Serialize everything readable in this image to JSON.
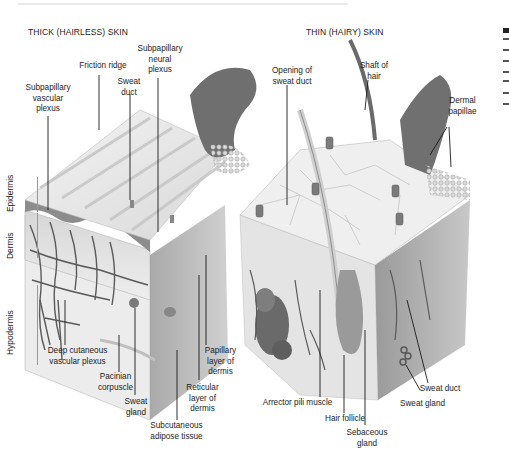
{
  "figure": {
    "thick_skin": {
      "title": "THICK (HAIRLESS) SKIN",
      "labels": {
        "friction_ridge": "Friction ridge",
        "subpapillary_neural_plexus": "Subpapillary\nneural\nplexus",
        "sweat_duct": "Sweat\nduct",
        "subpapillary_vascular_plexus": "Subpapillary\nvascular\nplexus",
        "deep_cutaneous_vascular_plexus": "Deep cutaneous\nvascular plexus",
        "pacinian_corpuscle": "Pacinian\ncorpuscle",
        "sweat_gland": "Sweat\ngland",
        "subcutaneous_adipose_tissue": "Subcutaneous\nadipose tissue",
        "reticular_layer": "Reticular\nlayer of\ndermis",
        "papillary_layer": "Papillary\nlayer of\ndermis"
      },
      "layers": {
        "epidermis": "Epidermis",
        "dermis": "Dermis",
        "hypodermis": "Hypodermis"
      }
    },
    "thin_skin": {
      "title": "THIN (HAIRY) SKIN",
      "labels": {
        "opening_of_sweat_duct": "Opening of\nsweat duct",
        "shaft_of_hair": "Shaft of\nhair",
        "dermal_papillae": "Dermal\npapillae",
        "arrector_pili_muscle": "Arrector pili muscle",
        "hair_follicle": "Hair follicle",
        "sebaceous_gland": "Sebaceous\ngland",
        "sweat_duct": "Sweat duct",
        "sweat_gland": "Sweat gland"
      }
    },
    "colors": {
      "epidermis_surface": "#e6e6e6",
      "dermis": "#cfcfcf",
      "dark_tissue": "#6e6e6e",
      "vessels": "#5a5a5a",
      "leader_line": "#1a1a1a"
    }
  }
}
